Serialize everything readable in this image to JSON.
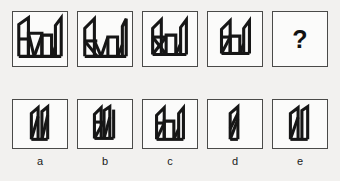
{
  "puzzle": {
    "type": "visual-sequence-reasoning",
    "question_marker": "?",
    "sequence": [
      {
        "index": 1,
        "name": "sequence-panel-1",
        "description": "Five angular spike shapes with two inner rectangles, densest figure",
        "element_count": 5
      },
      {
        "index": 2,
        "name": "sequence-panel-2",
        "description": "Four angular spike shapes with one inner rectangle and crossing diagonals",
        "element_count": 4
      },
      {
        "index": 3,
        "name": "sequence-panel-3",
        "description": "Three angular shapes with crossed diagonals and a central rectangle",
        "element_count": 3
      },
      {
        "index": 4,
        "name": "sequence-panel-4",
        "description": "Two angular shapes over a rectangle, simplest of the sequence",
        "element_count": 2
      },
      {
        "index": 5,
        "name": "sequence-panel-question",
        "description": "Unknown panel to be determined",
        "element_count": 0
      }
    ],
    "options": [
      {
        "label": "a",
        "name": "option-a",
        "description": "Two narrow leaning blades side by side on a short base"
      },
      {
        "label": "b",
        "name": "option-b",
        "description": "Angular shape with small inner quadrilateral and two blades on a base"
      },
      {
        "label": "c",
        "name": "option-c",
        "description": "Wide angular form with notched top and tall right blade"
      },
      {
        "label": "d",
        "name": "option-d",
        "description": "Single narrow tall blade with internal diagonal strokes"
      },
      {
        "label": "e",
        "name": "option-e",
        "description": "Two blades with flat left top edge joined at a base"
      }
    ]
  }
}
